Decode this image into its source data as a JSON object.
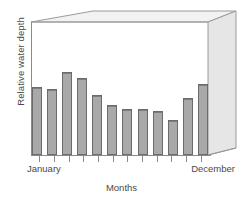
{
  "chart_data": {
    "type": "bar",
    "title": "",
    "xlabel": "Months",
    "ylabel": "Relative water depth",
    "categories": [
      "January",
      "February",
      "March",
      "April",
      "May",
      "June",
      "July",
      "August",
      "September",
      "October",
      "November",
      "December"
    ],
    "tick_labels_shown": [
      "January",
      "December"
    ],
    "values": [
      64,
      62,
      78,
      72,
      56,
      47,
      43,
      43,
      41,
      33,
      53,
      66
    ],
    "ylim": [
      0,
      100
    ],
    "xlim_ticks": 12,
    "grid": false,
    "legend": null,
    "bar_fill_color": "#a9a9a9",
    "bar_edge_color": "#6b6b6b",
    "axis_color": "#8a8a8a",
    "background_color": "#ffffff",
    "frame_fill_color": "#ececec",
    "frame_edge_color": "#9a9a9a",
    "frame_style": "3d-box"
  },
  "axes": {
    "y_title": "Relative water depth",
    "x_title": "Months",
    "x_first_label": "January",
    "x_last_label": "December"
  }
}
